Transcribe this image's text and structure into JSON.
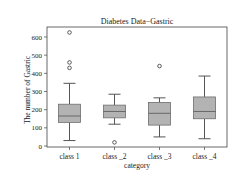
{
  "chart_data": {
    "type": "box",
    "title": "Diabetes Data−Gastric",
    "xlabel": "category",
    "ylabel": "The number of Gastric",
    "ylim": [
      -10,
      660
    ],
    "yticks": [
      0,
      100,
      200,
      300,
      400,
      500,
      600
    ],
    "ytick_labels": [
      "0",
      "100",
      "200",
      "300",
      "400",
      "500",
      "600"
    ],
    "categories": [
      "class  1",
      "class _2",
      "class _3",
      "class _4"
    ],
    "grid": false,
    "series": [
      {
        "name": "class  1",
        "whisker_low": 30,
        "q1": 130,
        "median": 165,
        "q3": 230,
        "whisker_high": 345,
        "outliers": [
          625,
          460,
          430
        ]
      },
      {
        "name": "class _2",
        "whisker_low": 120,
        "q1": 155,
        "median": 190,
        "q3": 225,
        "whisker_high": 285,
        "outliers": [
          20
        ]
      },
      {
        "name": "class _3",
        "whisker_low": 50,
        "q1": 115,
        "median": 180,
        "q3": 240,
        "whisker_high": 265,
        "outliers": [
          440
        ]
      },
      {
        "name": "class _4",
        "whisker_low": 40,
        "q1": 150,
        "median": 190,
        "q3": 270,
        "whisker_high": 385,
        "outliers": []
      }
    ],
    "colors": {
      "box_fill": "#b3b3b3",
      "box_edge": "#6e6e6e",
      "line": "#555555",
      "axis": "#444444"
    }
  }
}
